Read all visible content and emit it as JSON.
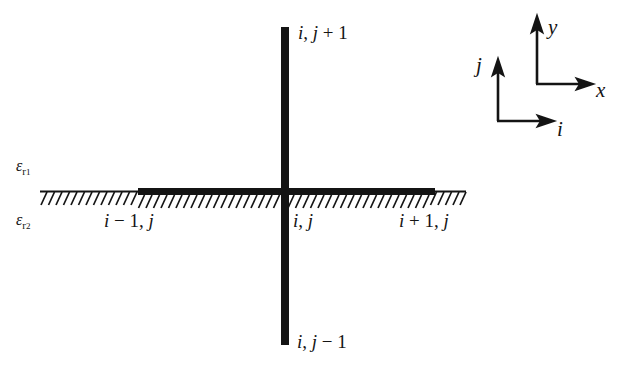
{
  "figure": {
    "background_color": "#ffffff",
    "ink_color": "#141414"
  },
  "nodes": {
    "top": "i, j + 1",
    "left": "i - 1, j",
    "center": "i, j",
    "right": "i + 1, j",
    "bottom": "i, j - 1"
  },
  "node_parts": {
    "top": {
      "i": "i",
      "comma": ", ",
      "j": "j",
      "op": " + ",
      "num": "1"
    },
    "left": {
      "i": "i",
      "op": " − ",
      "num": "1",
      "comma": ", ",
      "j": "j"
    },
    "center": {
      "i": "i",
      "comma": ", ",
      "j": "j"
    },
    "right": {
      "i": "i",
      "op": " + ",
      "num": "1",
      "comma": ", ",
      "j": "j"
    },
    "bottom": {
      "i": "i",
      "comma": ", ",
      "j": "j",
      "op": " − ",
      "num": "1"
    }
  },
  "materials": {
    "upper": {
      "symbol": "ε",
      "sub": "r",
      "subsub": "1"
    },
    "lower": {
      "symbol": "ε",
      "sub": "r",
      "subsub": "2"
    }
  },
  "axes": {
    "cartesian": {
      "x_label": "x",
      "y_label": "y"
    },
    "index": {
      "i_label": "i",
      "j_label": "j"
    }
  },
  "interface": {
    "hatch_side": "below",
    "hatch_angle_deg": 60,
    "hatch_count": 57
  }
}
